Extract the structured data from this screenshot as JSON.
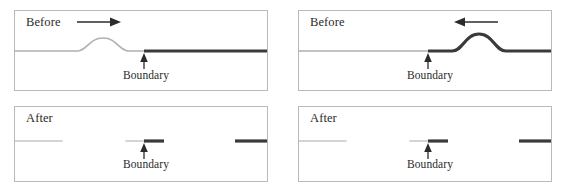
{
  "figure": {
    "width": 568,
    "height": 192,
    "background_color": "#ffffff"
  },
  "colors": {
    "panel_border": "#b9b9b9",
    "thin_string": "#b0b0b0",
    "thick_string": "#3a3a3a",
    "pulse_light": "#b0b0b0",
    "pulse_dark": "#3a3a3a",
    "arrow": "#2b2b2b",
    "text": "#2b2b2b",
    "faded_stub": "#c6c6c6"
  },
  "labels": {
    "before": "Before",
    "after": "After",
    "boundary": "Boundary"
  },
  "panels": [
    {
      "id": "top-left",
      "state_label": "Before",
      "boundary_label": "Boundary",
      "boundary_x_pct": 51,
      "left_medium": "thin-light-string",
      "right_medium": "thick-dark-string",
      "pulse": {
        "present": true,
        "side": "left",
        "medium": "thin-light-string",
        "polarity": "up",
        "center_x_pct": 35,
        "amplitude_px": 13,
        "half_width_px": 24
      },
      "direction_arrow": {
        "present": true,
        "direction": "right",
        "glyph": "arrow-right",
        "x_pct": 36,
        "y_px": 21
      },
      "stubs": []
    },
    {
      "id": "top-right",
      "state_label": "Before",
      "boundary_label": "Boundary",
      "boundary_x_pct": 51,
      "left_medium": "thin-light-string",
      "right_medium": "thick-dark-string",
      "pulse": {
        "present": true,
        "side": "right",
        "medium": "thick-dark-string",
        "polarity": "up",
        "center_x_pct": 70,
        "amplitude_px": 16,
        "half_width_px": 23
      },
      "direction_arrow": {
        "present": true,
        "direction": "left",
        "glyph": "arrow-left",
        "x_pct": 70,
        "y_px": 21
      },
      "stubs": []
    },
    {
      "id": "bottom-left",
      "state_label": "After",
      "boundary_label": "Boundary",
      "boundary_x_pct": 51,
      "left_medium": "erased",
      "right_medium": "erased",
      "pulse": {
        "present": false
      },
      "direction_arrow": {
        "present": false
      },
      "stubs": [
        {
          "name": "far-left-stub",
          "x_start_pct": 0,
          "x_end_pct": 19,
          "style": "thin-faded"
        },
        {
          "name": "pre-boundary-stub",
          "x_start_pct": 44,
          "x_end_pct": 51,
          "style": "thin-faded"
        },
        {
          "name": "post-boundary-stub",
          "x_start_pct": 51,
          "x_end_pct": 59,
          "style": "thick-dark"
        },
        {
          "name": "far-right-stub",
          "x_start_pct": 87,
          "x_end_pct": 100,
          "style": "thick-dark"
        }
      ]
    },
    {
      "id": "bottom-right",
      "state_label": "After",
      "boundary_label": "Boundary",
      "boundary_x_pct": 51,
      "left_medium": "erased",
      "right_medium": "erased",
      "pulse": {
        "present": false
      },
      "direction_arrow": {
        "present": false
      },
      "stubs": [
        {
          "name": "far-left-stub",
          "x_start_pct": 0,
          "x_end_pct": 19,
          "style": "thin-faded"
        },
        {
          "name": "pre-boundary-stub",
          "x_start_pct": 44,
          "x_end_pct": 51,
          "style": "thin-faded"
        },
        {
          "name": "post-boundary-stub",
          "x_start_pct": 51,
          "x_end_pct": 59,
          "style": "thick-dark"
        },
        {
          "name": "far-right-stub",
          "x_start_pct": 87,
          "x_end_pct": 100,
          "style": "thick-dark"
        }
      ]
    }
  ]
}
